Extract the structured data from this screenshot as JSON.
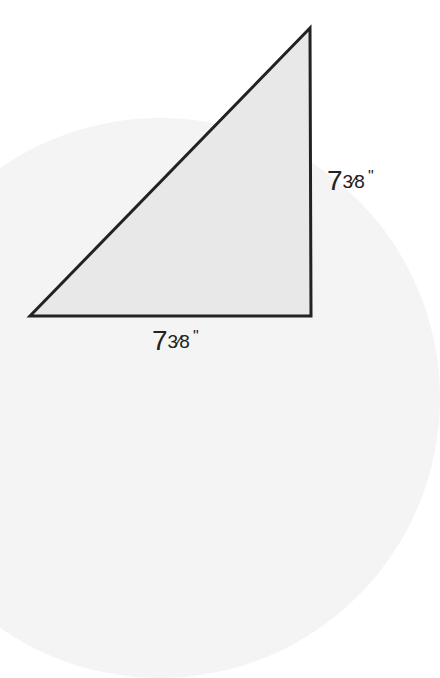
{
  "diagram": {
    "shape": "right-triangle",
    "fill_color": "#e8e8e8",
    "stroke_color": "#222222",
    "background_accent": "#f4f4f4",
    "vertices": {
      "top_right": [
        309,
        28
      ],
      "bottom_left": [
        30,
        316
      ],
      "bottom_right": [
        311,
        316
      ]
    },
    "labels": {
      "right_side": {
        "whole": "7",
        "fraction": "3⁄8",
        "unit": "\""
      },
      "bottom_side": {
        "whole": "7",
        "fraction": "3⁄8",
        "unit": "\""
      }
    }
  }
}
